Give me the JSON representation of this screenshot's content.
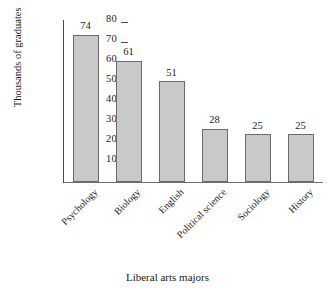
{
  "chart_data": {
    "type": "bar",
    "title": "",
    "xlabel": "Liberal arts majors",
    "ylabel": "Thousands of graduates",
    "categories": [
      "Psychology",
      "Biology",
      "English",
      "Political science",
      "Sociology",
      "History"
    ],
    "values": [
      74,
      61,
      51,
      28,
      25,
      25
    ],
    "value_labels": [
      "74",
      "61",
      "51",
      "28",
      "25",
      "25"
    ],
    "ylim": [
      0,
      80
    ],
    "ytick_labels": [
      "80",
      "70",
      "60",
      "50",
      "40",
      "30",
      "20",
      "10"
    ],
    "ytick_values": [
      80,
      70,
      60,
      50,
      40,
      30,
      20,
      10
    ],
    "grid": false,
    "legend": null,
    "bar_fill_color": "#c9c9c9",
    "bar_border_color": "#6a6a6a",
    "axis_color": "#4a4a4a",
    "background_color": "#ffffff",
    "text_color": "#1b1b1b"
  }
}
